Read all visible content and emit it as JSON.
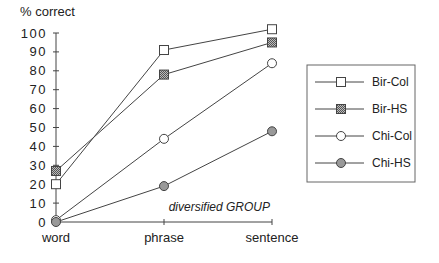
{
  "chart_data": {
    "type": "line",
    "title": "",
    "ylabel": "% correct",
    "xlabel": "",
    "categories": [
      "word",
      "phrase",
      "sentence"
    ],
    "ylim": [
      0,
      100
    ],
    "yticks": [
      0,
      10,
      20,
      30,
      40,
      50,
      60,
      70,
      80,
      90,
      100
    ],
    "grid": false,
    "legend_position": "right",
    "annotation": "diversified GROUP",
    "series": [
      {
        "name": "Bir-Col",
        "marker": "square-open",
        "values": [
          20,
          91,
          102
        ]
      },
      {
        "name": "Bir-HS",
        "marker": "square-hatched",
        "values": [
          27,
          78,
          95
        ]
      },
      {
        "name": "Chi-Col",
        "marker": "circle-open",
        "values": [
          1,
          44,
          84
        ]
      },
      {
        "name": "Chi-HS",
        "marker": "circle-filled",
        "values": [
          0,
          19,
          48
        ]
      }
    ]
  }
}
